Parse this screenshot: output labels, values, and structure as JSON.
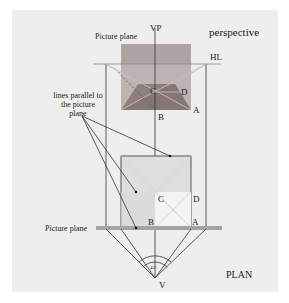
{
  "labels": {
    "vp": "VP",
    "perspective": "perspective",
    "picture_plane_top": "Picture plane",
    "hl": "HL",
    "parallel_note": [
      "lines parallel to",
      "the picture",
      "plane"
    ],
    "persp_C": "C",
    "persp_D": "D",
    "persp_A": "A",
    "persp_B": "B",
    "plan_C": "C",
    "plan_D": "D",
    "plan_B": "B",
    "plan_A": "A",
    "picture_plane_bottom": "Picture plane",
    "angle": "45°",
    "v": "V",
    "plan": "PLAN"
  },
  "colors": {
    "panel_bg": "#eeeeee",
    "picture_plane_fill": "#a89a9a",
    "trapezoid_fill": "#8a7a7a",
    "trapezoid_front": "#7a6a6a",
    "plan_upper_fill": "#dcdcdc",
    "plan_lower_light": "#f2f2f2",
    "ground_line": "#a0a0a0",
    "line": "#333333"
  }
}
